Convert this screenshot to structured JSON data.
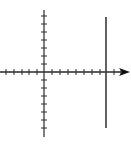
{
  "diagram": {
    "type": "coordinate-plane",
    "colors": {
      "axis": "#2a2a2a",
      "line": "#3a3a3a",
      "background": "#ffffff"
    },
    "origin": {
      "x": 44,
      "y": 72
    },
    "x_axis": {
      "start": 0,
      "end": 130,
      "arrow": true
    },
    "y_axis": {
      "start": 10,
      "end": 137,
      "arrow": false
    },
    "x_ticks": [
      6,
      14,
      22,
      29,
      37,
      52,
      60,
      68,
      76,
      84,
      92,
      100,
      114,
      121
    ],
    "y_ticks": [
      16,
      24,
      32,
      40,
      48,
      56,
      64,
      80,
      88,
      96,
      104,
      112,
      120,
      128
    ],
    "vertical_line": {
      "x": 106,
      "y1": 17,
      "y2": 128
    }
  }
}
